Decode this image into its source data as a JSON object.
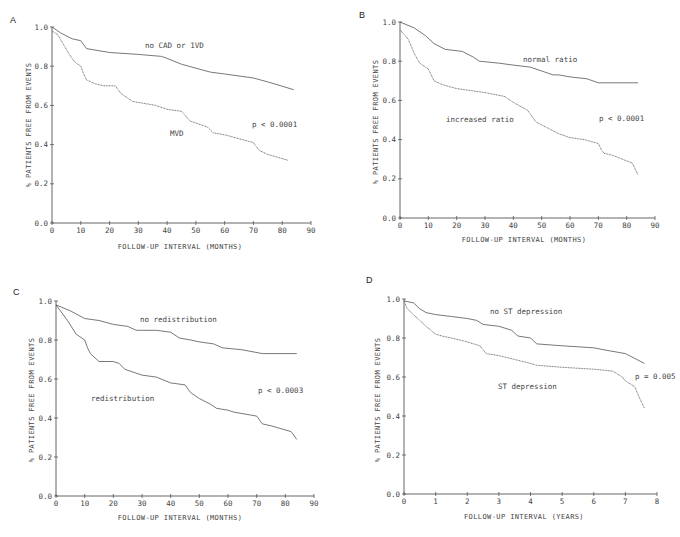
{
  "chart_data": [
    {
      "panel": "A",
      "type": "line",
      "title": "",
      "xlabel": "FOLLOW-UP INTERVAL (MONTHS)",
      "ylabel": "% PATIENTS FREE FROM EVENTS",
      "xlim": [
        0,
        90
      ],
      "ylim": [
        0,
        1.0
      ],
      "xticks": [
        0,
        10,
        20,
        30,
        40,
        50,
        60,
        70,
        80,
        90
      ],
      "yticks": [
        "0.0",
        "0.2",
        "0.4",
        "0.6",
        "0.8",
        "1.0"
      ],
      "grid": false,
      "annotation": "p < 0.0001",
      "series": [
        {
          "name": "no CAD or 1VD",
          "style": "solid",
          "x": [
            0,
            3,
            7,
            10,
            12,
            20,
            30,
            38,
            40,
            45,
            50,
            55,
            60,
            65,
            70,
            75,
            84
          ],
          "y": [
            1.0,
            0.97,
            0.94,
            0.93,
            0.89,
            0.87,
            0.86,
            0.85,
            0.84,
            0.81,
            0.79,
            0.77,
            0.76,
            0.75,
            0.74,
            0.72,
            0.68
          ]
        },
        {
          "name": "MVD",
          "style": "dotted",
          "x": [
            0,
            2,
            4,
            6,
            8,
            10,
            11,
            12,
            15,
            18,
            22,
            24,
            28,
            32,
            36,
            40,
            45,
            48,
            50,
            54,
            56,
            60,
            65,
            70,
            72,
            75,
            82
          ],
          "y": [
            0.98,
            0.96,
            0.91,
            0.86,
            0.82,
            0.8,
            0.76,
            0.73,
            0.71,
            0.7,
            0.7,
            0.66,
            0.62,
            0.61,
            0.6,
            0.58,
            0.57,
            0.52,
            0.51,
            0.49,
            0.46,
            0.45,
            0.43,
            0.41,
            0.37,
            0.35,
            0.32
          ]
        }
      ]
    },
    {
      "panel": "B",
      "type": "line",
      "title": "",
      "xlabel": "FOLLOW-UP INTERVAL (MONTHS)",
      "ylabel": "% PATIENTS FREE FROM EVENTS",
      "xlim": [
        0,
        90
      ],
      "ylim": [
        0,
        1.0
      ],
      "xticks": [
        0,
        10,
        20,
        30,
        40,
        50,
        60,
        70,
        80,
        90
      ],
      "yticks": [
        "0.0",
        "0.2",
        "0.4",
        "0.6",
        "0.8",
        "1.0"
      ],
      "grid": false,
      "annotation": "p < 0.0001",
      "series": [
        {
          "name": "normal ratio",
          "style": "solid",
          "x": [
            0,
            5,
            9,
            12,
            16,
            22,
            26,
            28,
            35,
            40,
            46,
            50,
            54,
            56,
            60,
            66,
            70,
            72,
            84
          ],
          "y": [
            1.0,
            0.97,
            0.93,
            0.89,
            0.86,
            0.85,
            0.82,
            0.8,
            0.79,
            0.78,
            0.77,
            0.75,
            0.73,
            0.73,
            0.72,
            0.71,
            0.69,
            0.69,
            0.69
          ]
        },
        {
          "name": "increased ratio",
          "style": "dotted",
          "x": [
            0,
            3,
            5,
            7,
            10,
            11,
            12,
            15,
            20,
            30,
            37,
            40,
            45,
            48,
            52,
            56,
            60,
            65,
            70,
            71,
            72,
            75,
            82,
            84
          ],
          "y": [
            0.96,
            0.91,
            0.84,
            0.79,
            0.76,
            0.73,
            0.7,
            0.68,
            0.66,
            0.64,
            0.62,
            0.59,
            0.55,
            0.49,
            0.46,
            0.43,
            0.41,
            0.4,
            0.38,
            0.35,
            0.33,
            0.32,
            0.28,
            0.22
          ]
        }
      ]
    },
    {
      "panel": "C",
      "type": "line",
      "title": "",
      "xlabel": "FOLLOW-UP INTERVAL (MONTHS)",
      "ylabel": "% PATIENTS FREE FROM EVENTS",
      "xlim": [
        0,
        90
      ],
      "ylim": [
        0,
        1.0
      ],
      "xticks": [
        0,
        10,
        20,
        30,
        40,
        50,
        60,
        70,
        80,
        90
      ],
      "yticks": [
        "0.0",
        "0.2",
        "0.4",
        "0.6",
        "0.8",
        "1.0"
      ],
      "grid": false,
      "annotation": "p < 0.0003",
      "series": [
        {
          "name": "no redistribution",
          "style": "solid",
          "x": [
            0,
            5,
            10,
            15,
            20,
            25,
            28,
            35,
            40,
            43,
            47,
            50,
            55,
            58,
            65,
            72,
            84
          ],
          "y": [
            0.98,
            0.95,
            0.91,
            0.9,
            0.88,
            0.87,
            0.85,
            0.85,
            0.84,
            0.81,
            0.8,
            0.79,
            0.78,
            0.76,
            0.75,
            0.73,
            0.73
          ]
        },
        {
          "name": "redistribution",
          "style": "solid",
          "x": [
            0,
            4,
            7,
            10,
            11,
            12,
            15,
            20,
            22,
            24,
            30,
            35,
            40,
            45,
            47,
            50,
            54,
            56,
            60,
            62,
            70,
            72,
            75,
            82,
            84
          ],
          "y": [
            0.98,
            0.9,
            0.83,
            0.8,
            0.76,
            0.73,
            0.69,
            0.69,
            0.68,
            0.65,
            0.62,
            0.61,
            0.58,
            0.57,
            0.53,
            0.5,
            0.47,
            0.45,
            0.44,
            0.43,
            0.41,
            0.37,
            0.36,
            0.33,
            0.29
          ]
        }
      ]
    },
    {
      "panel": "D",
      "type": "line",
      "title": "",
      "xlabel": "FOLLOW-UP INTERVAL (YEARS)",
      "ylabel": "% PATIENTS FREE FROM EVENTS",
      "xlim": [
        0,
        8
      ],
      "ylim": [
        0,
        1.0
      ],
      "xticks": [
        0,
        1,
        2,
        3,
        4,
        5,
        6,
        7,
        8
      ],
      "yticks": [
        "0.0",
        "0.2",
        "0.4",
        "0.6",
        "0.8",
        "1.0"
      ],
      "grid": false,
      "annotation": "p = 0.005",
      "series": [
        {
          "name": "no ST depression",
          "style": "solid",
          "x": [
            0,
            0.3,
            0.5,
            0.7,
            1.0,
            1.5,
            2.0,
            2.3,
            2.5,
            3.0,
            3.4,
            3.6,
            4.0,
            4.2,
            5.0,
            6.0,
            6.3,
            7.0,
            7.6
          ],
          "y": [
            0.99,
            0.98,
            0.95,
            0.93,
            0.92,
            0.91,
            0.9,
            0.89,
            0.87,
            0.86,
            0.84,
            0.81,
            0.8,
            0.77,
            0.76,
            0.75,
            0.74,
            0.72,
            0.67
          ]
        },
        {
          "name": "ST depression",
          "style": "dotted",
          "x": [
            0,
            0.1,
            0.3,
            0.5,
            0.7,
            1.0,
            1.2,
            1.5,
            2.0,
            2.4,
            2.6,
            3.0,
            3.5,
            4.0,
            4.2,
            5.0,
            6.0,
            6.6,
            6.9,
            7.0,
            7.3,
            7.4,
            7.6
          ],
          "y": [
            0.99,
            0.95,
            0.92,
            0.89,
            0.86,
            0.82,
            0.81,
            0.8,
            0.78,
            0.76,
            0.72,
            0.71,
            0.69,
            0.67,
            0.66,
            0.65,
            0.64,
            0.63,
            0.6,
            0.58,
            0.55,
            0.51,
            0.44
          ]
        }
      ]
    }
  ],
  "panels": {
    "A": {
      "letter": "A",
      "box": {
        "left": 0,
        "top": 0,
        "width": 340,
        "height": 260
      },
      "axes": {
        "x0": 52,
        "x1": 311,
        "y0": 223,
        "y1": 27
      },
      "labels": [
        {
          "text": "no CAD or 1VD",
          "x": 145,
          "y": 48
        },
        {
          "text": "MVD",
          "x": 170,
          "y": 136
        },
        {
          "text": "p < 0.0001",
          "x": 252,
          "y": 127
        }
      ],
      "ylabel_pos": {
        "x": 31,
        "y": 125
      },
      "xlabel_pos": {
        "x": 180,
        "y": 249
      }
    },
    "B": {
      "letter": "B",
      "box": {
        "left": 340,
        "top": 0,
        "width": 340,
        "height": 260
      },
      "axes": {
        "x0": 400,
        "x1": 655,
        "y0": 218,
        "y1": 22
      },
      "labels": [
        {
          "text": "normal ratio",
          "x": 523,
          "y": 62
        },
        {
          "text": "increased ratio",
          "x": 446,
          "y": 122
        },
        {
          "text": "p < 0.0001",
          "x": 599,
          "y": 121
        }
      ],
      "ylabel_pos": {
        "x": 378,
        "y": 122
      },
      "xlabel_pos": {
        "x": 524,
        "y": 242
      }
    },
    "C": {
      "letter": "C",
      "box": {
        "left": 0,
        "top": 260,
        "width": 340,
        "height": 277
      },
      "axes": {
        "x0": 56,
        "x1": 314,
        "y0": 496,
        "y1": 301
      },
      "labels": [
        {
          "text": "no redistribution",
          "x": 140,
          "y": 322
        },
        {
          "text": "redistribution",
          "x": 91,
          "y": 401
        },
        {
          "text": "p < 0.0003",
          "x": 258,
          "y": 393
        }
      ],
      "ylabel_pos": {
        "x": 34,
        "y": 400
      },
      "xlabel_pos": {
        "x": 180,
        "y": 520
      }
    },
    "D": {
      "letter": "D",
      "box": {
        "left": 340,
        "top": 260,
        "width": 340,
        "height": 277
      },
      "axes": {
        "x0": 404,
        "x1": 657,
        "y0": 494,
        "y1": 299
      },
      "labels": [
        {
          "text": "no ST depression",
          "x": 490,
          "y": 314
        },
        {
          "text": "ST depression",
          "x": 498,
          "y": 389
        },
        {
          "text": "p = 0.005",
          "x": 635,
          "y": 379
        }
      ],
      "ylabel_pos": {
        "x": 380,
        "y": 400
      },
      "xlabel_pos": {
        "x": 524,
        "y": 519
      }
    }
  }
}
